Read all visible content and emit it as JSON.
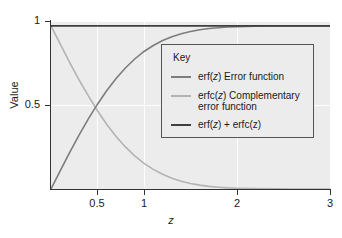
{
  "chart_data": {
    "type": "line",
    "title": "",
    "xlabel": "z",
    "ylabel": "Value",
    "xlim": [
      0,
      3
    ],
    "ylim": [
      0,
      1.03
    ],
    "grid": true,
    "grid_color": "#fdfdfd",
    "panel_background": "#ececec",
    "legend_position": "center-right",
    "xticks": [
      0.5,
      1,
      2,
      3
    ],
    "xticklabels": [
      "0.5",
      "1",
      "2",
      "3"
    ],
    "yticks": [
      0.5,
      1
    ],
    "yticklabels": [
      "0.5",
      "1"
    ],
    "series": [
      {
        "name": "erf(z) Error function",
        "short": "erf(z)",
        "color": "#7d7d7d",
        "x": [
          0.0,
          0.1,
          0.2,
          0.3,
          0.4,
          0.5,
          0.6,
          0.7,
          0.8,
          0.9,
          1.0,
          1.1,
          1.2,
          1.3,
          1.4,
          1.5,
          1.6,
          1.7,
          1.8,
          1.9,
          2.0,
          2.2,
          2.4,
          2.6,
          2.8,
          3.0
        ],
        "values": [
          0.0,
          0.112,
          0.223,
          0.329,
          0.428,
          0.52,
          0.604,
          0.678,
          0.742,
          0.797,
          0.843,
          0.88,
          0.91,
          0.934,
          0.952,
          0.966,
          0.976,
          0.984,
          0.989,
          0.993,
          0.995,
          0.998,
          0.999,
          1.0,
          1.0,
          1.0
        ]
      },
      {
        "name": "erfc(z) Complementary error function",
        "short": "erfc(z)",
        "color": "#b3b3b3",
        "x": [
          0.0,
          0.1,
          0.2,
          0.3,
          0.4,
          0.5,
          0.6,
          0.7,
          0.8,
          0.9,
          1.0,
          1.1,
          1.2,
          1.3,
          1.4,
          1.5,
          1.6,
          1.7,
          1.8,
          1.9,
          2.0,
          2.2,
          2.4,
          2.6,
          2.8,
          3.0
        ],
        "values": [
          1.0,
          0.888,
          0.777,
          0.671,
          0.572,
          0.48,
          0.396,
          0.322,
          0.258,
          0.203,
          0.157,
          0.12,
          0.09,
          0.066,
          0.048,
          0.034,
          0.024,
          0.016,
          0.011,
          0.007,
          0.005,
          0.002,
          0.001,
          0.0,
          0.0,
          0.0
        ]
      },
      {
        "name": "erf(z) + erfc(z)",
        "short": "erf(z) + erfc(z)",
        "color": "#3f3f3f",
        "x": [
          0.0,
          3.0
        ],
        "values": [
          1.0,
          1.0
        ]
      }
    ]
  },
  "legend": {
    "title": "Key",
    "entries": [
      {
        "label_prefix": "erf(",
        "label_var": "z",
        "label_suffix": ") Error function"
      },
      {
        "label_prefix": "erfc(",
        "label_var": "z",
        "label_suffix": ") Complementary error function"
      },
      {
        "label_prefix": "erf(",
        "label_var": "z",
        "label_suffix": ") + erfc(z)"
      }
    ],
    "entry_labels": [
      "erf(z) Error function",
      "erfc(z) Complementary error function",
      "erf(z) + erfc(z)"
    ]
  },
  "axes": {
    "x_label": "z",
    "y_label": "Value",
    "x_tick_labels": [
      "0.5",
      "1",
      "2",
      "3"
    ],
    "y_tick_labels": [
      "1",
      "0.5"
    ]
  }
}
